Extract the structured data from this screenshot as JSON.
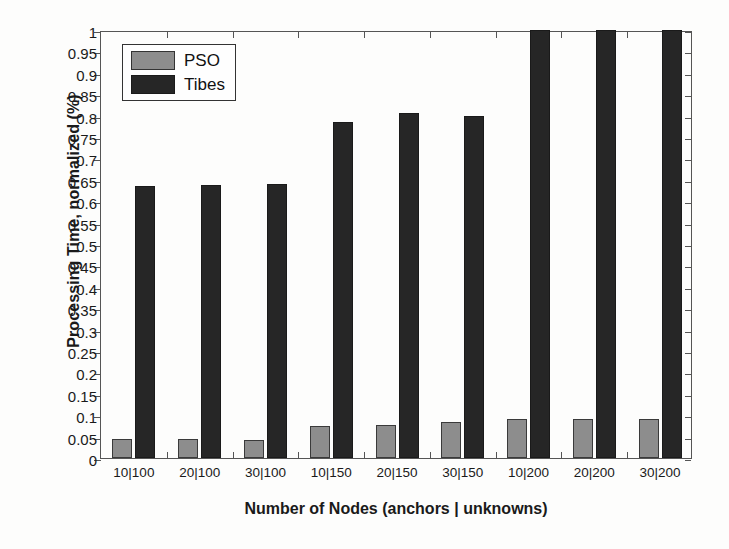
{
  "chart_data": {
    "type": "bar",
    "title": "",
    "xlabel": "Number of Nodes (anchors | unknowns)",
    "ylabel": "Processing Time, normalized (%)",
    "categories": [
      "10|100",
      "20|100",
      "30|100",
      "10|150",
      "20|150",
      "30|150",
      "10|200",
      "20|200",
      "30|200"
    ],
    "series": [
      {
        "name": "PSO",
        "color": "#8d8d8d",
        "values": [
          0.045,
          0.045,
          0.043,
          0.075,
          0.077,
          0.083,
          0.09,
          0.09,
          0.09
        ]
      },
      {
        "name": "Tibes",
        "color": "#262626",
        "values": [
          0.635,
          0.637,
          0.64,
          0.785,
          0.805,
          0.8,
          1.0,
          1.0,
          1.0
        ]
      }
    ],
    "ylim": [
      0,
      1
    ],
    "ytick_values": [
      0,
      0.05,
      0.1,
      0.15,
      0.2,
      0.25,
      0.3,
      0.35,
      0.4,
      0.45,
      0.5,
      0.55,
      0.6,
      0.65,
      0.7,
      0.75,
      0.8,
      0.85,
      0.9,
      0.95,
      1
    ],
    "ytick_labels": [
      "0",
      "0.05",
      "0.1",
      "0.15",
      "0.2",
      "0.25",
      "0.3",
      "0.35",
      "0.4",
      "0.45",
      "0.5",
      "0.55",
      "0.6",
      "0.65",
      "0.7",
      "0.75",
      "0.8",
      "0.85",
      "0.9",
      "0.95",
      "1"
    ],
    "grid": false,
    "legend_position": "top-left",
    "legend_entries": [
      "PSO",
      "Tibes"
    ]
  }
}
